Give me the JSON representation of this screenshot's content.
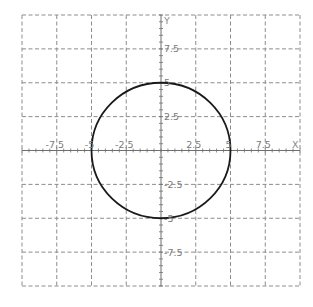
{
  "chart_data": {
    "type": "line",
    "title": "",
    "xlabel": "X",
    "ylabel": "Y",
    "xlim": [
      -10,
      10
    ],
    "ylim": [
      -10,
      10
    ],
    "grid": true,
    "grid_style": "dashed",
    "grid_step": 2.5,
    "minor_tick_step": 0.5,
    "x_tick_labels": [
      "-7.5",
      "-5",
      "-2.5",
      "2.5",
      "5",
      "7.5"
    ],
    "y_tick_labels": [
      "7.5",
      "5",
      "2.5",
      "-2.5",
      "-5",
      "-7.5"
    ],
    "series": [
      {
        "name": "circle",
        "shape": "circle",
        "equation": "x^2 + y^2 = 25",
        "center": [
          0,
          0
        ],
        "radius": 5,
        "color": "#1a1a1a"
      }
    ],
    "legend": null
  },
  "colors": {
    "grid": "#8c8c8c",
    "axis": "#6e6e6e",
    "curve": "#1a1a1a",
    "labels": "#7a7a7a"
  }
}
